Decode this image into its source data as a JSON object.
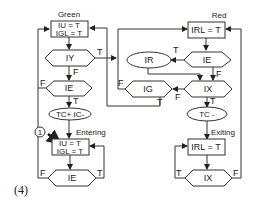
{
  "figure_label": "(4)",
  "states": {
    "green": {
      "title": "Green",
      "line1": "IU = T",
      "line2": "IGL = T"
    },
    "red": {
      "title": "Red",
      "line1": "IRL = T"
    },
    "entering": {
      "title": "Entering",
      "line1": "IU = T",
      "line2": "IGL = T"
    },
    "exiting": {
      "title": "Exiting",
      "line1": "IRL = T"
    }
  },
  "decisions": {
    "iy": "IY",
    "ie_left": "IE",
    "ie_entering": "IE",
    "ie_red": "IE",
    "ix": "IX",
    "ig": "IG",
    "ix_exiting": "IX"
  },
  "actions": {
    "tc_plus_ic_minus": "TC+   IC-",
    "ir": "IR",
    "tc_minus": "TC -"
  },
  "marker": "1",
  "edge_labels": {
    "true": "T",
    "false": "F"
  }
}
